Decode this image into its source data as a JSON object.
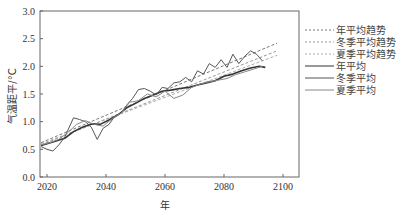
{
  "chart_data": {
    "type": "line",
    "title": "",
    "xlabel": "年",
    "ylabel": "气温距平/°C",
    "xlim": [
      2017,
      2106
    ],
    "ylim": [
      0.0,
      3.0
    ],
    "x_ticks": [
      "2020",
      "2040",
      "2060",
      "2080",
      "2100"
    ],
    "y_ticks": [
      "0.0",
      "0.5",
      "1.0",
      "1.5",
      "2.0",
      "2.5",
      "3.0"
    ],
    "grid": false,
    "legend_position": "right-outside",
    "series": [
      {
        "name": "年平均趋势",
        "style": "dashed",
        "color": "#777777",
        "x": [
          2018,
          2098
        ],
        "values": [
          0.62,
          2.42
        ]
      },
      {
        "name": "冬季平均趋势",
        "style": "dashed",
        "color": "#999999",
        "x": [
          2018,
          2098
        ],
        "values": [
          0.58,
          2.28
        ]
      },
      {
        "name": "夏季平均趋势",
        "style": "dashed",
        "color": "#aaaaaa",
        "x": [
          2018,
          2098
        ],
        "values": [
          0.6,
          2.2
        ]
      },
      {
        "name": "年平均",
        "style": "solid",
        "color": "#333333",
        "x": [
          2018,
          2022,
          2026,
          2029,
          2032,
          2035,
          2038,
          2041,
          2044,
          2047,
          2050,
          2053,
          2056,
          2059,
          2062,
          2065,
          2068,
          2071,
          2074,
          2077,
          2080,
          2083,
          2086,
          2089,
          2092,
          2094
        ],
        "values": [
          0.57,
          0.63,
          0.7,
          0.82,
          0.9,
          0.96,
          0.95,
          1.03,
          1.12,
          1.25,
          1.33,
          1.42,
          1.48,
          1.55,
          1.57,
          1.6,
          1.62,
          1.66,
          1.7,
          1.74,
          1.82,
          1.86,
          1.92,
          1.97,
          2.0,
          1.98
        ]
      },
      {
        "name": "冬季平均",
        "style": "solid",
        "color": "#555555",
        "x": [
          2018,
          2020,
          2022,
          2024,
          2026,
          2029,
          2031,
          2033,
          2035,
          2037,
          2039,
          2041,
          2043,
          2045,
          2047,
          2049,
          2051,
          2053,
          2055,
          2057,
          2059,
          2061,
          2063,
          2065,
          2067,
          2069,
          2071,
          2073,
          2075,
          2077,
          2079,
          2081,
          2083,
          2085,
          2087,
          2089,
          2091,
          2093
        ],
        "values": [
          0.55,
          0.5,
          0.47,
          0.58,
          0.72,
          1.07,
          1.04,
          1.0,
          0.9,
          0.68,
          0.88,
          0.95,
          1.1,
          1.15,
          1.3,
          1.42,
          1.58,
          1.6,
          1.55,
          1.48,
          1.62,
          1.6,
          1.7,
          1.72,
          1.8,
          1.72,
          1.92,
          1.86,
          2.05,
          1.98,
          2.12,
          1.98,
          2.22,
          2.05,
          2.18,
          2.28,
          2.22,
          2.1
        ]
      },
      {
        "name": "夏季平均",
        "style": "solid",
        "color": "#888888",
        "x": [
          2018,
          2021,
          2024,
          2027,
          2030,
          2033,
          2036,
          2039,
          2042,
          2045,
          2048,
          2051,
          2054,
          2057,
          2060,
          2063,
          2066,
          2069,
          2072,
          2075,
          2078,
          2081,
          2084,
          2087,
          2090,
          2093
        ],
        "values": [
          0.58,
          0.62,
          0.68,
          0.8,
          0.95,
          1.02,
          0.95,
          0.92,
          1.05,
          1.15,
          1.35,
          1.38,
          1.5,
          1.45,
          1.55,
          1.42,
          1.48,
          1.62,
          1.68,
          1.72,
          1.75,
          1.78,
          1.85,
          1.9,
          1.95,
          2.0
        ]
      }
    ]
  }
}
